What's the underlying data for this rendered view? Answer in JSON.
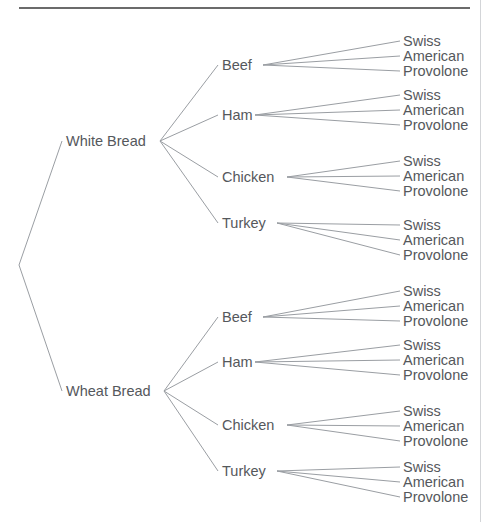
{
  "figure": {
    "type": "tree-diagram",
    "title_rule": "horizontal-rule",
    "root": {
      "label": "",
      "x": 19,
      "y": 265
    },
    "colors": {
      "text": "#55585c",
      "edge": "#9a9ea3",
      "rule": "#3a3a3a",
      "page_border": "#d3d5d8",
      "background": "#ffffff"
    },
    "levels": [
      "bread",
      "meat",
      "cheese"
    ]
  },
  "tree": {
    "breads": [
      {
        "label": "White Bread",
        "x": 66,
        "y": 146,
        "anchor_x": 160,
        "meats": [
          {
            "label": "Beef",
            "x": 222,
            "y": 70,
            "anchor_x": 263,
            "cheeses": [
              {
                "label": "Swiss",
                "x": 403,
                "y": 46
              },
              {
                "label": "American",
                "x": 403,
                "y": 61
              },
              {
                "label": "Provolone",
                "x": 403,
                "y": 76
              }
            ]
          },
          {
            "label": "Ham",
            "x": 222,
            "y": 120,
            "anchor_x": 255,
            "cheeses": [
              {
                "label": "Swiss",
                "x": 403,
                "y": 100
              },
              {
                "label": "American",
                "x": 403,
                "y": 115
              },
              {
                "label": "Provolone",
                "x": 403,
                "y": 130
              }
            ]
          },
          {
            "label": "Chicken",
            "x": 222,
            "y": 182,
            "anchor_x": 287,
            "cheeses": [
              {
                "label": "Swiss",
                "x": 403,
                "y": 166
              },
              {
                "label": "American",
                "x": 403,
                "y": 181
              },
              {
                "label": "Provolone",
                "x": 403,
                "y": 196
              }
            ]
          },
          {
            "label": "Turkey",
            "x": 222,
            "y": 228,
            "anchor_x": 277,
            "cheeses": [
              {
                "label": "Swiss",
                "x": 403,
                "y": 230
              },
              {
                "label": "American",
                "x": 403,
                "y": 245
              },
              {
                "label": "Provolone",
                "x": 403,
                "y": 260
              }
            ]
          }
        ]
      },
      {
        "label": "Wheat Bread",
        "x": 66,
        "y": 396,
        "anchor_x": 164,
        "meats": [
          {
            "label": "Beef",
            "x": 222,
            "y": 322,
            "anchor_x": 263,
            "cheeses": [
              {
                "label": "Swiss",
                "x": 403,
                "y": 296
              },
              {
                "label": "American",
                "x": 403,
                "y": 311
              },
              {
                "label": "Provolone",
                "x": 403,
                "y": 326
              }
            ]
          },
          {
            "label": "Ham",
            "x": 222,
            "y": 367,
            "anchor_x": 255,
            "cheeses": [
              {
                "label": "Swiss",
                "x": 403,
                "y": 350
              },
              {
                "label": "American",
                "x": 403,
                "y": 365
              },
              {
                "label": "Provolone",
                "x": 403,
                "y": 380
              }
            ]
          },
          {
            "label": "Chicken",
            "x": 222,
            "y": 430,
            "anchor_x": 287,
            "cheeses": [
              {
                "label": "Swiss",
                "x": 403,
                "y": 416
              },
              {
                "label": "American",
                "x": 403,
                "y": 431
              },
              {
                "label": "Provolone",
                "x": 403,
                "y": 446
              }
            ]
          },
          {
            "label": "Turkey",
            "x": 222,
            "y": 476,
            "anchor_x": 277,
            "cheeses": [
              {
                "label": "Swiss",
                "x": 403,
                "y": 472
              },
              {
                "label": "American",
                "x": 403,
                "y": 487
              },
              {
                "label": "Provolone",
                "x": 403,
                "y": 502
              }
            ]
          }
        ]
      }
    ]
  },
  "chart_data": {
    "type": "tree",
    "title": "",
    "levels": [
      "Bread",
      "Meat",
      "Cheese"
    ],
    "bread_options": [
      "White Bread",
      "Wheat Bread"
    ],
    "meat_options": [
      "Beef",
      "Ham",
      "Chicken",
      "Turkey"
    ],
    "cheese_options": [
      "Swiss",
      "American",
      "Provolone"
    ],
    "total_leaves": 24,
    "paths": [
      [
        "White Bread",
        "Beef",
        "Swiss"
      ],
      [
        "White Bread",
        "Beef",
        "American"
      ],
      [
        "White Bread",
        "Beef",
        "Provolone"
      ],
      [
        "White Bread",
        "Ham",
        "Swiss"
      ],
      [
        "White Bread",
        "Ham",
        "American"
      ],
      [
        "White Bread",
        "Ham",
        "Provolone"
      ],
      [
        "White Bread",
        "Chicken",
        "Swiss"
      ],
      [
        "White Bread",
        "Chicken",
        "American"
      ],
      [
        "White Bread",
        "Chicken",
        "Provolone"
      ],
      [
        "White Bread",
        "Turkey",
        "Swiss"
      ],
      [
        "White Bread",
        "Turkey",
        "American"
      ],
      [
        "White Bread",
        "Turkey",
        "Provolone"
      ],
      [
        "Wheat Bread",
        "Beef",
        "Swiss"
      ],
      [
        "Wheat Bread",
        "Beef",
        "American"
      ],
      [
        "Wheat Bread",
        "Beef",
        "Provolone"
      ],
      [
        "Wheat Bread",
        "Ham",
        "Swiss"
      ],
      [
        "Wheat Bread",
        "Ham",
        "American"
      ],
      [
        "Wheat Bread",
        "Ham",
        "Provolone"
      ],
      [
        "Wheat Bread",
        "Chicken",
        "Swiss"
      ],
      [
        "Wheat Bread",
        "Chicken",
        "American"
      ],
      [
        "Wheat Bread",
        "Chicken",
        "Provolone"
      ],
      [
        "Wheat Bread",
        "Turkey",
        "Swiss"
      ],
      [
        "Wheat Bread",
        "Turkey",
        "American"
      ],
      [
        "Wheat Bread",
        "Turkey",
        "Provolone"
      ]
    ]
  }
}
